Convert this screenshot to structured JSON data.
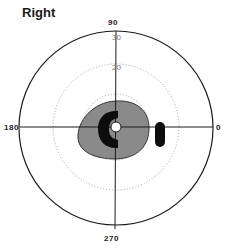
{
  "title": "Right",
  "axes": {
    "top": "90",
    "left": "180",
    "right": "0",
    "bottom": "270"
  },
  "rings": [
    {
      "label": "",
      "style": "dotted"
    },
    {
      "label": "20",
      "style": "dotted"
    },
    {
      "label": "30",
      "style": "solid"
    }
  ],
  "regions": [
    {
      "name": "relative-scotoma",
      "fill": "#8a8a8a"
    },
    {
      "name": "absolute-scotoma-c",
      "fill": "#0d0d0d"
    },
    {
      "name": "blind-spot",
      "fill": "#0d0d0d"
    },
    {
      "name": "fixation",
      "fill": "#ffffff"
    }
  ],
  "colors": {
    "line": "#1a1a1a",
    "dotted": "#888888",
    "gray": "#8a8a8a",
    "black": "#0d0d0d"
  }
}
